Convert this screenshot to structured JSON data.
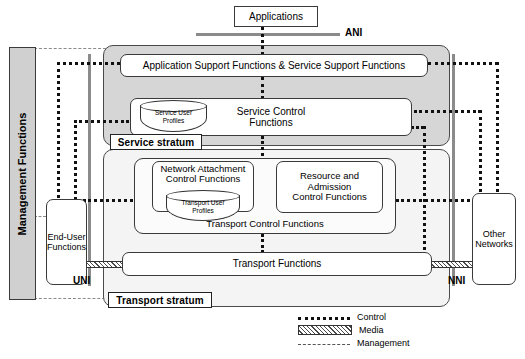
{
  "diagram": {
    "applications": {
      "label": "Applications"
    },
    "reference_points": {
      "ani": "ANI",
      "uni": "UNI",
      "nni": "NNI"
    },
    "management": {
      "label": "Management Functions"
    },
    "service_stratum": {
      "tag": "Service stratum",
      "application_support": "Application Support Functions & Service Support Functions",
      "service_control": "Service Control\nFunctions",
      "service_control_line1": "Service Control",
      "service_control_line2": "Functions",
      "service_user_profiles_line1": "Service User",
      "service_user_profiles_line2": "Profiles"
    },
    "transport_stratum": {
      "tag": "Transport stratum",
      "transport_control": "Transport Control Functions",
      "nacf_line1": "Network Attachment",
      "nacf_line2": "Control Functions",
      "racf_line1": "Resource and",
      "racf_line2": "Admission",
      "racf_line3": "Control Functions",
      "transport_user_profiles_line1": "Transport User",
      "transport_user_profiles_line2": "Profiles",
      "transport_functions": "Transport Functions"
    },
    "end_user": {
      "line1": "End-User",
      "line2": "Functions"
    },
    "other_networks": {
      "line1": "Other",
      "line2": "Networks"
    },
    "legend": {
      "items": [
        {
          "key": "control",
          "label": "Control"
        },
        {
          "key": "media",
          "label": "Media"
        },
        {
          "key": "management",
          "label": "Management"
        }
      ]
    },
    "colors": {
      "service_stratum_fill": "#d6d6d6",
      "transport_stratum_fill": "#f4f4f4",
      "management_fill": "#d0d0d0",
      "reference_line": "#8b8b8b",
      "stroke": "#333333",
      "background": "#ffffff"
    }
  }
}
